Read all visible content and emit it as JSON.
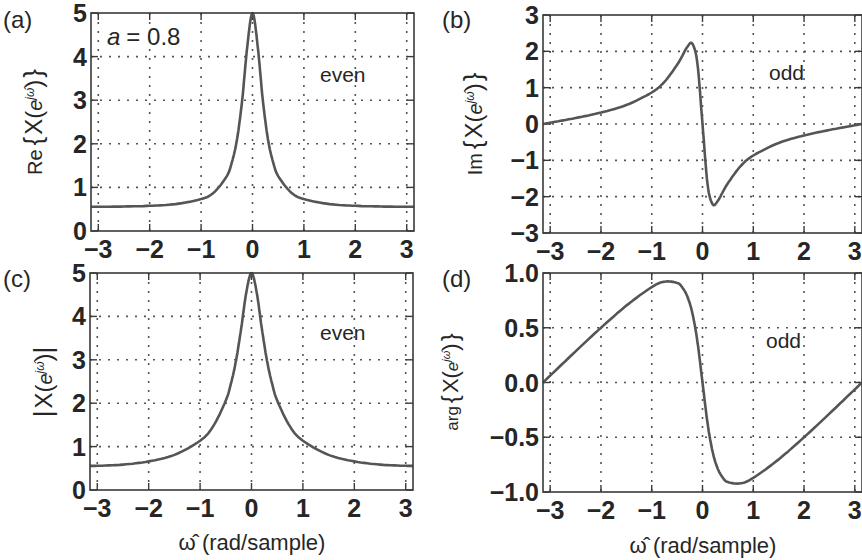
{
  "figure": {
    "parameter_label": "a = 0.8",
    "parameter_symbol": "a",
    "parameter_value": "= 0.8",
    "xlabel": "ω̂ (rad/sample)",
    "curve_color": "#555555",
    "grid_color": "#555555"
  },
  "chart_data": [
    {
      "id": "a",
      "type": "line",
      "panel_label": "(a)",
      "title": "",
      "ylabel": "Re{ X(e^{jω̂}) }",
      "ylabel_prefix": "Re",
      "xlabel": "",
      "annotation": "even",
      "extra_annotation": "a = 0.8",
      "xlim": [
        -3.1416,
        3.1416
      ],
      "ylim": [
        0,
        5
      ],
      "xticks": [
        -3,
        -2,
        -1,
        0,
        1,
        2,
        3
      ],
      "xtick_labels": [
        "−3",
        "−2",
        "−1",
        "0",
        "1",
        "2",
        "3"
      ],
      "yticks": [
        0,
        1,
        2,
        3,
        4,
        5
      ],
      "ytick_labels": [
        "0",
        "1",
        "2",
        "3",
        "4",
        "5"
      ],
      "grid": true,
      "x": [
        -3.1416,
        -3,
        -2.5,
        -2,
        -1.5,
        -1,
        -0.75,
        -0.5,
        -0.4,
        -0.3,
        -0.2,
        -0.1,
        0,
        0.1,
        0.2,
        0.3,
        0.4,
        0.5,
        0.75,
        1,
        1.5,
        2,
        2.5,
        3,
        3.1416
      ],
      "values": [
        0.556,
        0.556,
        0.562,
        0.578,
        0.618,
        0.732,
        0.884,
        1.26,
        1.58,
        2.11,
        3.01,
        4.25,
        5.0,
        4.25,
        3.01,
        2.11,
        1.58,
        1.26,
        0.884,
        0.732,
        0.618,
        0.578,
        0.562,
        0.556,
        0.556
      ]
    },
    {
      "id": "b",
      "type": "line",
      "panel_label": "(b)",
      "title": "",
      "ylabel": "Im{ X(e^{jω̂}) }",
      "ylabel_prefix": "Im",
      "xlabel": "",
      "annotation": "odd",
      "xlim": [
        -3.1416,
        3.1416
      ],
      "ylim": [
        -3,
        3
      ],
      "xticks": [
        -3,
        -2,
        -1,
        0,
        1,
        2,
        3
      ],
      "xtick_labels": [
        "−3",
        "−2",
        "−1",
        "0",
        "1",
        "2",
        "3"
      ],
      "yticks": [
        -3,
        -2,
        -1,
        0,
        1,
        2,
        3
      ],
      "ytick_labels": [
        "−3",
        "−2",
        "−1",
        "0",
        "1",
        "2",
        "3"
      ],
      "grid": true,
      "x": [
        -3.1416,
        -3,
        -2.5,
        -2,
        -1.5,
        -1,
        -0.75,
        -0.5,
        -0.4,
        -0.3,
        -0.2,
        -0.1,
        0,
        0.1,
        0.2,
        0.3,
        0.4,
        0.5,
        0.75,
        1,
        1.5,
        2,
        2.5,
        3,
        3.1416
      ],
      "values": [
        0,
        0.035,
        0.164,
        0.315,
        0.523,
        0.868,
        1.16,
        1.63,
        1.87,
        2.12,
        2.21,
        1.66,
        0,
        -1.66,
        -2.21,
        -2.12,
        -1.87,
        -1.63,
        -1.16,
        -0.868,
        -0.523,
        -0.315,
        -0.164,
        -0.035,
        0
      ]
    },
    {
      "id": "c",
      "type": "line",
      "panel_label": "(c)",
      "title": "",
      "ylabel": "|X(e^{jω̂})|",
      "xlabel": "ω̂ (rad/sample)",
      "annotation": "even",
      "xlim": [
        -3.1416,
        3.1416
      ],
      "ylim": [
        0,
        5
      ],
      "xticks": [
        -3,
        -2,
        -1,
        0,
        1,
        2,
        3
      ],
      "xtick_labels": [
        "−3",
        "−2",
        "−1",
        "0",
        "1",
        "2",
        "3"
      ],
      "yticks": [
        0,
        1,
        2,
        3,
        4,
        5
      ],
      "ytick_labels": [
        "0",
        "1",
        "2",
        "3",
        "4",
        "5"
      ],
      "grid": true,
      "x": [
        -3.1416,
        -3,
        -2.5,
        -2,
        -1.5,
        -1,
        -0.75,
        -0.5,
        -0.4,
        -0.3,
        -0.2,
        -0.1,
        0,
        0.1,
        0.2,
        0.3,
        0.4,
        0.5,
        0.75,
        1,
        1.5,
        2,
        2.5,
        3,
        3.1416
      ],
      "values": [
        0.556,
        0.557,
        0.585,
        0.659,
        0.809,
        1.136,
        1.46,
        2.06,
        2.45,
        2.99,
        3.73,
        4.56,
        5.0,
        4.56,
        3.73,
        2.99,
        2.45,
        2.06,
        1.46,
        1.136,
        0.809,
        0.659,
        0.585,
        0.557,
        0.556
      ]
    },
    {
      "id": "d",
      "type": "line",
      "panel_label": "(d)",
      "title": "",
      "ylabel": "arg{ X(e^{jω̂}) }",
      "ylabel_prefix": "arg",
      "xlabel": "ω̂ (rad/sample)",
      "annotation": "odd",
      "xlim": [
        -3.1416,
        3.1416
      ],
      "ylim": [
        -1.0,
        1.0
      ],
      "xticks": [
        -3,
        -2,
        -1,
        0,
        1,
        2,
        3
      ],
      "xtick_labels": [
        "−3",
        "−2",
        "−1",
        "0",
        "1",
        "2",
        "3"
      ],
      "yticks": [
        -1.0,
        -0.5,
        0.0,
        0.5,
        1.0
      ],
      "ytick_labels": [
        "−1.0",
        "−0.5",
        "0.0",
        "0.5",
        "1.0"
      ],
      "grid": true,
      "x": [
        -3.1416,
        -3,
        -2.5,
        -2,
        -1.5,
        -1,
        -0.75,
        -0.5,
        -0.4,
        -0.3,
        -0.2,
        -0.1,
        0,
        0.1,
        0.2,
        0.3,
        0.4,
        0.5,
        0.75,
        1,
        1.5,
        2,
        2.5,
        3,
        3.1416
      ],
      "values": [
        0,
        0.063,
        0.284,
        0.5,
        0.702,
        0.871,
        0.921,
        0.91,
        0.869,
        0.787,
        0.635,
        0.373,
        0,
        -0.373,
        -0.635,
        -0.787,
        -0.869,
        -0.91,
        -0.921,
        -0.871,
        -0.702,
        -0.5,
        -0.284,
        -0.063,
        0
      ]
    }
  ]
}
